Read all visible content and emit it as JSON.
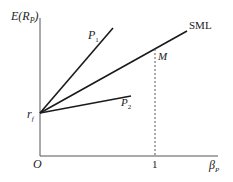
{
  "diagram": {
    "y_axis_label": "E(R",
    "y_axis_label_sub": "P",
    "y_axis_label_close": ")",
    "x_axis_label": "β",
    "x_axis_label_sub": "P",
    "origin_label": "O",
    "intercept_label": "r",
    "intercept_label_sub": "f",
    "x_tick_label": "1",
    "lines": [
      {
        "name": "P1",
        "label": "P",
        "label_sub": "1"
      },
      {
        "name": "SML",
        "label": "SML"
      },
      {
        "name": "P2",
        "label": "P",
        "label_sub": "2"
      }
    ],
    "market_point_label": "M",
    "colors": {
      "line": "#1a1a1a",
      "axis": "#555555",
      "dashed": "#555555"
    }
  }
}
